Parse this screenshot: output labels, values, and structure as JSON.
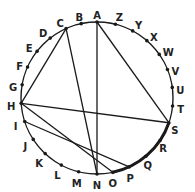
{
  "diagram": {
    "type": "circle-chord-diagram",
    "center": [
      97,
      98
    ],
    "radius": 76,
    "stroke_color": "#1a1a1a",
    "points": [
      {
        "label": "A",
        "angle": 0,
        "lx": 0,
        "ly": -6
      },
      {
        "label": "Z",
        "angle": 14,
        "lx": 4,
        "ly": -6
      },
      {
        "label": "Y",
        "angle": 28,
        "lx": 6,
        "ly": -5
      },
      {
        "label": "X",
        "angle": 41,
        "lx": 7,
        "ly": -3
      },
      {
        "label": "W",
        "angle": 55,
        "lx": 9,
        "ly": -1
      },
      {
        "label": "V",
        "angle": 68,
        "lx": 8,
        "ly": 2
      },
      {
        "label": "U",
        "angle": 82,
        "lx": 8,
        "ly": 4
      },
      {
        "label": "T",
        "angle": 96,
        "lx": 8,
        "ly": 4
      },
      {
        "label": "S",
        "angle": 109,
        "lx": 6,
        "ly": 8
      },
      {
        "label": "R",
        "angle": 124,
        "lx": 3,
        "ly": 9
      },
      {
        "label": "Q",
        "angle": 140,
        "lx": 2,
        "ly": 10
      },
      {
        "label": "P",
        "angle": 155,
        "lx": 1,
        "ly": 12
      },
      {
        "label": "O",
        "angle": 168,
        "lx": 0,
        "ly": 12
      },
      {
        "label": "N",
        "angle": 180,
        "lx": 0,
        "ly": 12
      },
      {
        "label": "M",
        "angle": 194,
        "lx": -2,
        "ly": 12
      },
      {
        "label": "L",
        "angle": 208,
        "lx": -4,
        "ly": 11
      },
      {
        "label": "K",
        "angle": 223,
        "lx": -6,
        "ly": 10
      },
      {
        "label": "J",
        "angle": 237,
        "lx": -8,
        "ly": 8
      },
      {
        "label": "I",
        "angle": 252,
        "lx": -9,
        "ly": 6
      },
      {
        "label": "H",
        "angle": 266,
        "lx": -10,
        "ly": 4
      },
      {
        "label": "G",
        "angle": 280,
        "lx": -9,
        "ly": 3
      },
      {
        "label": "F",
        "angle": 294,
        "lx": -8,
        "ly": 0
      },
      {
        "label": "E",
        "angle": 308,
        "lx": -8,
        "ly": -2
      },
      {
        "label": "D",
        "angle": 322,
        "lx": -7,
        "ly": -4
      },
      {
        "label": "C",
        "angle": 336,
        "lx": -6,
        "ly": -5
      },
      {
        "label": "B",
        "angle": 348,
        "lx": -2,
        "ly": -6
      }
    ],
    "chords": [
      [
        "C",
        "H"
      ],
      [
        "C",
        "N"
      ],
      [
        "A",
        "N"
      ],
      [
        "A",
        "S"
      ],
      [
        "H",
        "S"
      ],
      [
        "H",
        "O"
      ],
      [
        "I",
        "P"
      ]
    ],
    "bold_arc": {
      "from": "S",
      "to": "O"
    }
  }
}
